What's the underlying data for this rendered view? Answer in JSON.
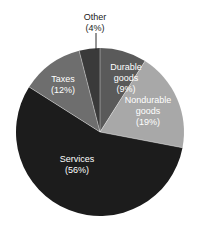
{
  "figure": {
    "background_color": "#ffffff",
    "width": 198,
    "height": 227
  },
  "chart_data": {
    "type": "pie",
    "title": "",
    "subtitle": "",
    "xlabel": "",
    "ylabel": "",
    "grid": false,
    "legend_position": "none",
    "label_format": "name (percent%)",
    "total_percent": 100,
    "start_angle_deg": 0,
    "direction": "clockwise",
    "center": {
      "x": 100,
      "y": 132
    },
    "radius": 84,
    "categories": [
      "Durable goods",
      "Nondurable goods",
      "Services",
      "Taxes",
      "Other"
    ],
    "values": [
      9,
      19,
      56,
      12,
      4
    ],
    "colors": [
      "#5a5a5a",
      "#a8a8a8",
      "#1c1c1c",
      "#6e6e6e",
      "#3a3a3a"
    ],
    "slices": [
      {
        "name": "Durable goods",
        "value": 9,
        "percent_text": "(9%)",
        "color": "#5a5a5a",
        "label_lines": [
          "Durable",
          "goods",
          "(9%)"
        ],
        "label_color": "#ffffff",
        "label_x": 126,
        "label_y": 70,
        "label_placement": "inside",
        "start_angle_deg": 0,
        "end_angle_deg": 32.4
      },
      {
        "name": "Nondurable goods",
        "value": 19,
        "percent_text": "(19%)",
        "color": "#a8a8a8",
        "label_lines": [
          "Nondurable",
          "goods",
          "(19%)"
        ],
        "label_color": "#ffffff",
        "label_x": 148,
        "label_y": 103,
        "label_placement": "inside",
        "start_angle_deg": 32.4,
        "end_angle_deg": 100.8
      },
      {
        "name": "Services",
        "value": 56,
        "percent_text": "(56%)",
        "color": "#1c1c1c",
        "label_lines": [
          "Services",
          "(56%)"
        ],
        "label_color": "#e8e8e8",
        "label_x": 77,
        "label_y": 162,
        "label_placement": "inside",
        "start_angle_deg": 100.8,
        "end_angle_deg": 302.4
      },
      {
        "name": "Taxes",
        "value": 12,
        "percent_text": "(12%)",
        "color": "#6e6e6e",
        "label_lines": [
          "Taxes",
          "(12%)"
        ],
        "label_color": "#ffffff",
        "label_x": 63,
        "label_y": 82,
        "label_placement": "inside",
        "start_angle_deg": 302.4,
        "end_angle_deg": 345.6
      },
      {
        "name": "Other",
        "value": 4,
        "percent_text": "(4%)",
        "color": "#3a3a3a",
        "label_lines": [
          "Other",
          "(4%)"
        ],
        "label_color": "#1a1a1a",
        "label_x": 95,
        "label_y": 20,
        "label_placement": "callout",
        "leader_line": {
          "x1": 96,
          "y1": 33,
          "x2": 96,
          "y2": 50
        },
        "start_angle_deg": 345.6,
        "end_angle_deg": 360
      }
    ]
  }
}
